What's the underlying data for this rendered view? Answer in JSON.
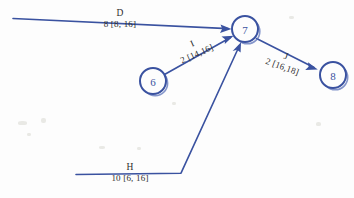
{
  "diagram": {
    "type": "activity-on-arrow-network",
    "title": "",
    "ink_color": "#3a52a0",
    "text_color": "#2d2d2d",
    "background_color": "#fdfdfd",
    "nodes": [
      {
        "id": "6",
        "label": "6",
        "cx": 153,
        "cy": 81,
        "r": 13
      },
      {
        "id": "7",
        "label": "7",
        "cx": 245,
        "cy": 29,
        "r": 13
      },
      {
        "id": "8",
        "label": "8",
        "cx": 333,
        "cy": 75,
        "r": 13
      }
    ],
    "edges": [
      {
        "id": "D",
        "activity": "D",
        "duration_label": "8 [8, 16]",
        "duration": 8,
        "window": [
          8,
          16
        ],
        "from": "",
        "to": "7",
        "orientation": "horizontal"
      },
      {
        "id": "I",
        "activity": "I",
        "duration_label": "2 [14,16]",
        "duration": 2,
        "window": [
          14,
          16
        ],
        "from": "6",
        "to": "7",
        "orientation": "diagonal-up"
      },
      {
        "id": "H",
        "activity": "H",
        "duration_label": "10 [6, 16]",
        "duration": 10,
        "window": [
          6,
          16
        ],
        "from": "",
        "to": "7",
        "orientation": "horizontal-then-diagonal"
      },
      {
        "id": "J",
        "activity": "J",
        "duration_label": "2 [16,18]",
        "duration": 2,
        "window": [
          16,
          18
        ],
        "from": "7",
        "to": "8",
        "orientation": "diagonal-down"
      }
    ]
  }
}
